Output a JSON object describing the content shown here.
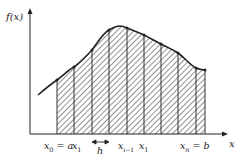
{
  "diagram": {
    "y_axis_label": "f(x)",
    "x_axis_label": "x",
    "labels": {
      "x0_main": "x",
      "x0_sub": "0",
      "x0_eq": " = a",
      "x1_main": "x",
      "x1_sub": "1",
      "h": "h",
      "xim1_main": "x",
      "xim1_sub": "i−1",
      "xi_main": "x",
      "xi_sub": "1",
      "xn_main": "x",
      "xn_sub": "n",
      "xn_eq": " = b"
    },
    "colors": {
      "line": "#222222",
      "hatch": "#555555",
      "background": "#ffffff"
    },
    "axis": {
      "origin": [
        30,
        134
      ],
      "x_end": 228,
      "y_end": 8
    },
    "grid_x": [
      57,
      74,
      92,
      109,
      127,
      144,
      161,
      178,
      196
    ],
    "curve_points": [
      [
        38,
        95
      ],
      [
        57,
        80
      ],
      [
        74,
        67
      ],
      [
        92,
        50
      ],
      [
        109,
        30
      ],
      [
        120,
        26
      ],
      [
        127,
        28
      ],
      [
        144,
        35
      ],
      [
        161,
        44
      ],
      [
        178,
        53
      ],
      [
        196,
        68
      ],
      [
        205,
        70
      ]
    ],
    "nodes": [
      [
        57,
        80
      ],
      [
        74,
        67
      ],
      [
        92,
        50
      ],
      [
        109,
        30
      ],
      [
        127,
        28
      ],
      [
        144,
        35
      ],
      [
        161,
        44
      ],
      [
        178,
        53
      ],
      [
        196,
        68
      ]
    ]
  }
}
